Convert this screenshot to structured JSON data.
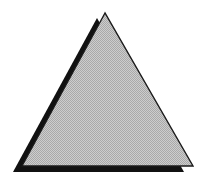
{
  "figure": {
    "colors": {
      "background": "#ffffff",
      "fill": "#c8c8c8",
      "fill_dither": "#a8a8a8",
      "outline": "#1a1a1a",
      "shadow": "#111111"
    },
    "triangle": {
      "apex": [
        105,
        13
      ],
      "left": [
        22,
        166
      ],
      "right": [
        193,
        166
      ]
    },
    "shadow": {
      "apex": [
        97,
        18
      ],
      "left": [
        13,
        172
      ],
      "right": [
        184,
        172
      ]
    }
  }
}
